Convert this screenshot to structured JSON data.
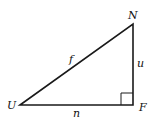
{
  "diagram": {
    "type": "right-triangle",
    "vertices": [
      {
        "name": "U",
        "x": 20,
        "y": 105
      },
      {
        "name": "N",
        "x": 133,
        "y": 24
      },
      {
        "name": "F",
        "x": 133,
        "y": 105
      }
    ],
    "sides": [
      {
        "label": "f",
        "from": "U",
        "to": "N"
      },
      {
        "label": "u",
        "from": "N",
        "to": "F"
      },
      {
        "label": "n",
        "from": "U",
        "to": "F"
      }
    ],
    "right_angle_at": "F",
    "labels": {
      "vertex_u": "U",
      "vertex_n": "N",
      "vertex_f": "F",
      "side_f": "f",
      "side_u": "u",
      "side_n": "n"
    },
    "colors": {
      "stroke": "#1a1a1a",
      "background": "#ffffff"
    }
  }
}
